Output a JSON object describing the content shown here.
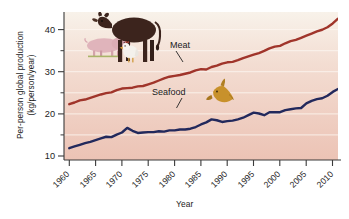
{
  "chart_data": {
    "type": "line",
    "title": "",
    "xlabel": "Year",
    "ylabel": "Per-person global production (kg/person/year)",
    "ylabel_line1": "Per-person global production",
    "ylabel_line2": "(kg/person/year)",
    "xlim": [
      1960,
      2012
    ],
    "ylim": [
      10,
      45
    ],
    "grid": true,
    "grid_orientation": "horizontal",
    "legend_position": "inline-annotations",
    "y_ticks": [
      10,
      20,
      30,
      40
    ],
    "y_minor_ticks": [
      15,
      25,
      35
    ],
    "x_ticks": [
      1960,
      1965,
      1970,
      1975,
      1980,
      1985,
      1990,
      1995,
      2000,
      2005,
      2010
    ],
    "x_tick_labels": [
      "1960",
      "1965",
      "1970",
      "1975",
      "1980",
      "1985",
      "1990",
      "1995",
      "2000",
      "2005",
      "2010"
    ],
    "series": [
      {
        "name": "Meat",
        "color": "#a0352b",
        "x": [
          1961,
          1962,
          1963,
          1964,
          1965,
          1966,
          1967,
          1968,
          1969,
          1970,
          1971,
          1972,
          1973,
          1974,
          1975,
          1976,
          1977,
          1978,
          1979,
          1980,
          1981,
          1982,
          1983,
          1984,
          1985,
          1986,
          1987,
          1988,
          1989,
          1990,
          1991,
          1992,
          1993,
          1994,
          1995,
          1996,
          1997,
          1998,
          1999,
          2000,
          2001,
          2002,
          2003,
          2004,
          2005,
          2006,
          2007,
          2008,
          2009,
          2010,
          2011,
          2012
        ],
        "values": [
          23.2,
          23.6,
          24.1,
          24.3,
          24.7,
          25.1,
          25.5,
          25.8,
          26.0,
          26.5,
          26.9,
          27.0,
          27.1,
          27.4,
          27.5,
          27.9,
          28.3,
          28.8,
          29.3,
          29.7,
          29.9,
          30.1,
          30.4,
          30.7,
          31.2,
          31.5,
          31.4,
          32.0,
          32.3,
          32.8,
          33.1,
          33.2,
          33.6,
          34.1,
          34.5,
          34.9,
          35.3,
          35.8,
          36.4,
          36.8,
          37.0,
          37.6,
          38.1,
          38.4,
          38.9,
          39.4,
          39.9,
          40.4,
          40.8,
          41.4,
          42.3,
          43.4
        ]
      },
      {
        "name": "Seafood",
        "color": "#22295c",
        "x": [
          1961,
          1962,
          1963,
          1964,
          1965,
          1966,
          1967,
          1968,
          1969,
          1970,
          1971,
          1972,
          1973,
          1974,
          1975,
          1976,
          1977,
          1978,
          1979,
          1980,
          1981,
          1982,
          1983,
          1984,
          1985,
          1986,
          1987,
          1988,
          1989,
          1990,
          1991,
          1992,
          1993,
          1994,
          1995,
          1996,
          1997,
          1998,
          1999,
          2000,
          2001,
          2002,
          2003,
          2004,
          2005,
          2006,
          2007,
          2008,
          2009,
          2010,
          2011,
          2012
        ],
        "values": [
          12.8,
          13.2,
          13.6,
          14.0,
          14.3,
          14.7,
          15.1,
          15.5,
          15.4,
          16.0,
          16.5,
          17.6,
          16.9,
          16.4,
          16.5,
          16.6,
          16.6,
          16.8,
          16.7,
          17.0,
          17.0,
          17.2,
          17.2,
          17.4,
          17.8,
          18.4,
          18.9,
          19.6,
          19.4,
          19.0,
          19.2,
          19.3,
          19.6,
          20.0,
          20.6,
          21.2,
          21.0,
          20.6,
          21.3,
          21.3,
          21.3,
          21.8,
          22.0,
          22.2,
          22.3,
          23.4,
          24.0,
          24.4,
          24.6,
          25.2,
          26.1,
          26.8
        ]
      }
    ],
    "annotations": [
      {
        "label": "Meat",
        "for": "Meat",
        "x_px": 170,
        "y_px": 46
      },
      {
        "label": "Seafood",
        "for": "Seafood",
        "x_px": 175,
        "y_px": 93
      }
    ],
    "illustrations": [
      {
        "name": "cow-illustration",
        "color": "#3b251e"
      },
      {
        "name": "pig-illustration",
        "color": "#e3b9bf"
      },
      {
        "name": "chicken-illustration",
        "color": "#f2f0ec"
      },
      {
        "name": "fish-illustration",
        "color": "#c8912b"
      }
    ],
    "plot_background": {
      "top_color": "#f7f1e8",
      "bottom_color": "#eec6b8",
      "gridline_color": "#fdf6ef"
    }
  }
}
